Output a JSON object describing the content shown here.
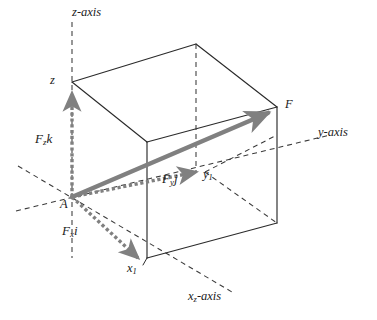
{
  "figure": {
    "kind": "3d-force-vector-decomposition-diagram",
    "colors": {
      "background": "#ffffff",
      "box_edge": "#2b2b2b",
      "dashed_line": "#3a3a3a",
      "vector_gray": "#808080",
      "text": "#1a1a1a"
    }
  },
  "axes": [
    {
      "id": "z-axis",
      "label": "z-axis",
      "label_base": "z",
      "label_suffix": "-axis"
    },
    {
      "id": "y-axis",
      "label": "y-axis",
      "label_base": "y",
      "label_suffix": "-axis"
    },
    {
      "id": "x-axis",
      "label": "x-axis",
      "label_base": "x",
      "label_suffix": "-axis",
      "subscript": "z"
    }
  ],
  "points": [
    {
      "id": "A",
      "label": "A"
    },
    {
      "id": "F",
      "label": "F"
    },
    {
      "id": "z1",
      "label": "z",
      "subscript": ""
    },
    {
      "id": "y1",
      "label": "y",
      "subscript": "1"
    },
    {
      "id": "x1",
      "label": "x",
      "subscript": "1"
    }
  ],
  "vectors": [
    {
      "id": "resultant",
      "label": "F",
      "subscript": "",
      "unit": "",
      "style": "solid-gray",
      "from": "A",
      "to": "F"
    },
    {
      "id": "component-x",
      "label": "F",
      "subscript": "x",
      "unit": "i",
      "style": "dotted-gray",
      "from": "A",
      "to": "x1"
    },
    {
      "id": "component-y",
      "label": "F",
      "subscript": "y",
      "unit": "j",
      "style": "dotted-gray",
      "from": "A",
      "to": "y1"
    },
    {
      "id": "component-z",
      "label": "F",
      "subscript": "z",
      "unit": "k",
      "style": "dotted-gray",
      "from": "A",
      "to": "z1"
    }
  ],
  "labels": {
    "z_axis": {
      "base": "z",
      "sub": "",
      "tail": "-axis"
    },
    "y_axis": {
      "base": "y",
      "sub": "",
      "tail": "-axis"
    },
    "x_axis": {
      "base": "x",
      "sub": "z",
      "tail": "-axis"
    },
    "point_A": {
      "base": "A",
      "sub": "",
      "tail": ""
    },
    "point_F": {
      "base": "F",
      "sub": "",
      "tail": ""
    },
    "point_z1": {
      "base": "z",
      "sub": "",
      "tail": ""
    },
    "point_y1": {
      "base": "y",
      "sub": "1",
      "tail": ""
    },
    "point_x1": {
      "base": "x",
      "sub": "1",
      "tail": ""
    },
    "vector_Fzk": {
      "base": "F",
      "sub": "z",
      "tail": "k"
    },
    "vector_Fxi": {
      "base": "F",
      "sub": "x",
      "tail": "i"
    },
    "vector_Fyj": {
      "base": "F",
      "sub": "y",
      "tail": "j"
    }
  }
}
